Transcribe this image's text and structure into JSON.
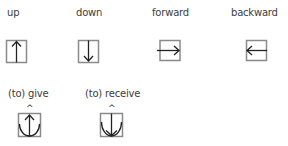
{
  "colors": {
    "box": "#8a8a8a",
    "stroke": "#222222",
    "text": "#3c3c3c"
  },
  "items": [
    {
      "label": "up",
      "icon": "up-arrow-box-icon"
    },
    {
      "label": "down",
      "icon": "down-arrow-box-icon"
    },
    {
      "label": "forward",
      "icon": "right-arrow-box-icon"
    },
    {
      "label": "backward",
      "icon": "left-arrow-box-icon"
    },
    {
      "label": "(to) give",
      "icon": "give-glyph-icon",
      "marker": "^"
    },
    {
      "label": "(to) receive",
      "icon": "receive-glyph-icon",
      "marker": "^"
    }
  ]
}
